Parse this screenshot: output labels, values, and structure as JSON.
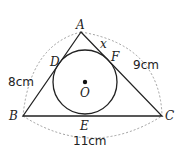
{
  "diagram": {
    "points": {
      "A": "A",
      "B": "B",
      "C": "C",
      "D": "D",
      "E": "E",
      "F": "F",
      "O": "O"
    },
    "unknown": "x",
    "measurements": {
      "AB": "8cm",
      "AC": "9cm",
      "BC": "11cm"
    },
    "colors": {
      "line": "#222222",
      "dashed": "#888888"
    }
  }
}
